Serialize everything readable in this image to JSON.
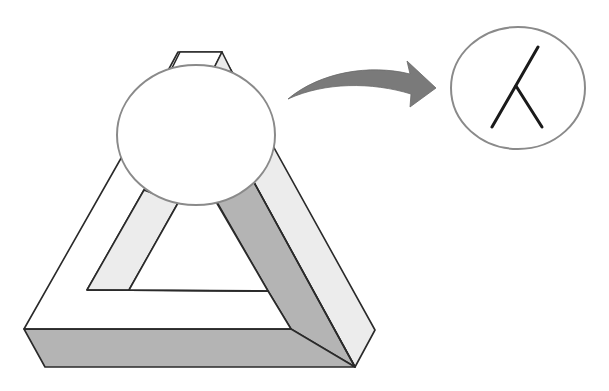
{
  "diagram": {
    "elements": {
      "triangle": {
        "name": "penrose-triangle",
        "faces": [
          "white",
          "light-gray",
          "dark-gray"
        ]
      },
      "occluder": {
        "name": "occluding-ellipse"
      },
      "arrow": {
        "name": "curved-arrow",
        "direction": "right"
      },
      "inset": {
        "name": "magnified-junction",
        "glyph": "Y-junction lines"
      }
    },
    "colors": {
      "background": "#ffffff",
      "face_white": "#ffffff",
      "face_light": "#ececec",
      "face_dark": "#b4b4b4",
      "edge": "#2a2a2a",
      "ellipse_stroke": "#8a8a8a",
      "arrow_fill": "#7a7a7a",
      "junction_stroke": "#1a1a1a"
    }
  }
}
